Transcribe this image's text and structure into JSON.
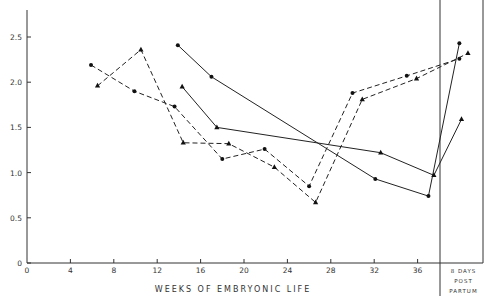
{
  "chart_data": {
    "type": "line",
    "title": "",
    "xlabel": "WEEKS OF EMBRYONIC LIFE",
    "ylabel": "",
    "xlim": [
      0,
      38
    ],
    "ylim": [
      0,
      2.5
    ],
    "x_ticks": [
      0,
      4,
      8,
      12,
      16,
      20,
      24,
      28,
      32,
      36
    ],
    "x_tick_labels": [
      "0",
      "4",
      "8",
      "12",
      "16",
      "20",
      "24",
      "28",
      "32",
      "36"
    ],
    "y_ticks": [
      0,
      0.5,
      1.0,
      1.5,
      2.0,
      2.5
    ],
    "y_tick_labels": [
      "0",
      "0.5",
      "1.0",
      "1.5",
      "2.0",
      "2.5"
    ],
    "grid": false,
    "legend": null,
    "post_partum_label": [
      "8 DAYS",
      "POST",
      "PARTUM"
    ],
    "series": [
      {
        "name": "dashed-circle",
        "line_style": "dashed",
        "marker": "circle",
        "points": [
          {
            "x": 5.9,
            "y": 2.19
          },
          {
            "x": 9.9,
            "y": 1.9
          },
          {
            "x": 13.6,
            "y": 1.73
          },
          {
            "x": 18.0,
            "y": 1.15
          },
          {
            "x": 21.9,
            "y": 1.26
          },
          {
            "x": 26.0,
            "y": 0.85
          },
          {
            "x": 30.0,
            "y": 1.88
          },
          {
            "x": 35.0,
            "y": 2.07
          }
        ],
        "post_partum": {
          "x_offset": 0.45,
          "y": 2.26
        }
      },
      {
        "name": "dashed-triangle",
        "line_style": "dashed",
        "marker": "triangle",
        "points": [
          {
            "x": 6.5,
            "y": 1.96
          },
          {
            "x": 10.5,
            "y": 2.36
          },
          {
            "x": 14.4,
            "y": 1.33
          },
          {
            "x": 18.6,
            "y": 1.32
          },
          {
            "x": 22.8,
            "y": 1.06
          },
          {
            "x": 26.6,
            "y": 0.67
          },
          {
            "x": 30.9,
            "y": 1.81
          },
          {
            "x": 35.9,
            "y": 2.04
          }
        ],
        "post_partum": {
          "x_offset": 0.65,
          "y": 2.32
        }
      },
      {
        "name": "solid-circle",
        "line_style": "solid",
        "marker": "circle",
        "points": [
          {
            "x": 13.9,
            "y": 2.41
          },
          {
            "x": 17.0,
            "y": 2.06
          },
          {
            "x": 32.1,
            "y": 0.93
          },
          {
            "x": 37.0,
            "y": 0.74
          }
        ],
        "post_partum": {
          "x_offset": 0.45,
          "y": 2.43
        }
      },
      {
        "name": "solid-triangle",
        "line_style": "solid",
        "marker": "triangle",
        "points": [
          {
            "x": 14.3,
            "y": 1.95
          },
          {
            "x": 17.5,
            "y": 1.5
          },
          {
            "x": 32.6,
            "y": 1.22
          },
          {
            "x": 37.5,
            "y": 0.97
          }
        ],
        "post_partum": {
          "x_offset": 0.5,
          "y": 1.59
        }
      }
    ]
  }
}
